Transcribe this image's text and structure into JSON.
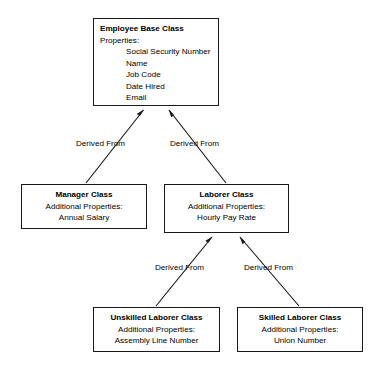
{
  "diagram": {
    "type": "uml-class-inheritance-diagram",
    "relationship_label": "Derived From",
    "classes": [
      {
        "id": "employee-base-class",
        "title": "Employee Base Class",
        "subtitle": "Properties:",
        "properties": [
          "Social Security Number",
          "Name",
          "Job Code",
          "Date Hired",
          "Email"
        ]
      },
      {
        "id": "manager-class",
        "title": "Manager Class",
        "subtitle": "Additional Properties:",
        "properties": [
          "Annual Salary"
        ]
      },
      {
        "id": "laborer-class",
        "title": "Laborer Class",
        "subtitle": "Additional Properties:",
        "properties": [
          "Hourly Pay Rate"
        ]
      },
      {
        "id": "unskilled-laborer-class",
        "title": "Unskilled Laborer Class",
        "subtitle": "Additional Properties:",
        "properties": [
          "Assembly Line Number"
        ]
      },
      {
        "id": "skilled-laborer-class",
        "title": "Skilled Laborer Class",
        "subtitle": "Additional Properties:",
        "properties": [
          "Union Number"
        ]
      }
    ],
    "edges": [
      {
        "id": "edge-manager-to-employee",
        "from": "manager-class",
        "to": "employee-base-class",
        "label": "Derived From"
      },
      {
        "id": "edge-laborer-to-employee",
        "from": "laborer-class",
        "to": "employee-base-class",
        "label": "Derived From"
      },
      {
        "id": "edge-unskilled-to-laborer",
        "from": "unskilled-laborer-class",
        "to": "laborer-class",
        "label": "Derived From"
      },
      {
        "id": "edge-skilled-to-laborer",
        "from": "skilled-laborer-class",
        "to": "laborer-class",
        "label": "Derived From"
      }
    ],
    "colors": {
      "background": "#ffffff",
      "box_border": "#1a1a1a",
      "box_fill": "#ffffff",
      "text": "#000000",
      "edge_line": "#1a1a1a"
    }
  }
}
